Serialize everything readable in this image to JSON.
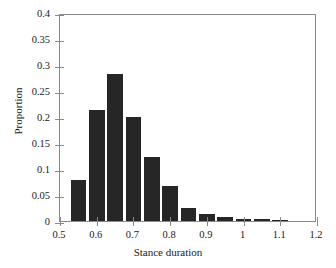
{
  "figure": {
    "background_color": "#ffffff",
    "bar_color": "#262626",
    "axis_color": "#8a8a8a",
    "text_color": "#1a1a1a"
  },
  "chart_data": {
    "type": "bar",
    "title": "",
    "subtitle": "",
    "xlabel": "Stance duration",
    "ylabel": "Proportion",
    "xlim": [
      0.5,
      1.2
    ],
    "ylim": [
      0,
      0.4
    ],
    "grid": false,
    "legend": null,
    "legend_position": "none",
    "xticks": [
      0.5,
      0.6,
      0.7,
      0.8,
      0.9,
      1.0,
      1.1,
      1.2
    ],
    "xtick_labels": [
      "0.5",
      "0.6",
      "0.7",
      "0.8",
      "0.9",
      "1",
      "1.1",
      "1.2"
    ],
    "yticks": [
      0,
      0.05,
      0.1,
      0.15,
      0.2,
      0.25,
      0.3,
      0.35,
      0.4
    ],
    "ytick_labels": [
      "0",
      "0.05",
      "0.1",
      "0.15",
      "0.2",
      "0.25",
      "0.3",
      "0.35",
      "0.4"
    ],
    "bin_width": 0.05,
    "bar_width_fraction": 0.85,
    "bin_centers": [
      0.55,
      0.6,
      0.65,
      0.7,
      0.75,
      0.8,
      0.85,
      0.9,
      0.95,
      1.0,
      1.05,
      1.1
    ],
    "bin_edges": [
      0.525,
      0.575,
      0.625,
      0.675,
      0.725,
      0.775,
      0.825,
      0.875,
      0.925,
      0.975,
      1.025,
      1.075,
      1.125
    ],
    "categories": [
      "0.55",
      "0.60",
      "0.65",
      "0.70",
      "0.75",
      "0.80",
      "0.85",
      "0.90",
      "0.95",
      "1.00",
      "1.05",
      "1.10"
    ],
    "values": [
      0.079,
      0.213,
      0.283,
      0.2,
      0.123,
      0.068,
      0.025,
      0.014,
      0.007,
      0.003,
      0.004,
      0.002
    ]
  }
}
